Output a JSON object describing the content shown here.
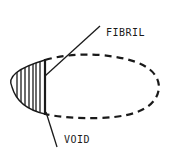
{
  "diagram": {
    "type": "schematic",
    "labels": {
      "fibril": "FIBRIL",
      "void": "VOID"
    },
    "colors": {
      "stroke": "#1a1a1a",
      "background": "#ffffff"
    },
    "elements": {
      "dashed_ellipse": {
        "cx": 100,
        "cy": 87,
        "rx": 58,
        "ry": 31,
        "style": "dashed"
      },
      "hatched_region": {
        "left_tip_x": 12,
        "right_edge_x": 45,
        "top_y": 60,
        "bottom_y": 114,
        "hatch": "vertical"
      },
      "fibril_leader": {
        "from": [
          45,
          76
        ],
        "to": [
          100,
          26
        ]
      },
      "void_leader": {
        "from": [
          46,
          112
        ],
        "to": [
          57,
          147
        ]
      }
    }
  }
}
